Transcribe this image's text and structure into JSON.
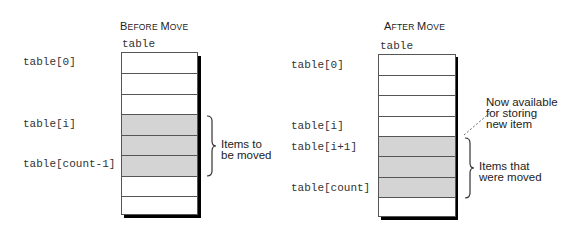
{
  "before": {
    "title_parts": [
      {
        "text": "B",
        "size": "big"
      },
      {
        "text": "EFORE ",
        "size": "small"
      },
      {
        "text": "M",
        "size": "big"
      },
      {
        "text": "OVE",
        "size": "small"
      }
    ],
    "title": "Before Move",
    "array_label": "table",
    "cells": 8,
    "shaded_cells": [
      3,
      4,
      5
    ],
    "index_labels": [
      {
        "text": "table[0]",
        "row": 0
      },
      {
        "text": "table[i]",
        "row": 3
      },
      {
        "text": "table[count-1]",
        "row": 5
      }
    ],
    "annotation": [
      "Items to",
      "be moved"
    ]
  },
  "after": {
    "title_parts": [
      {
        "text": "A",
        "size": "big"
      },
      {
        "text": "FTER ",
        "size": "small"
      },
      {
        "text": "M",
        "size": "big"
      },
      {
        "text": "OVE",
        "size": "small"
      }
    ],
    "title": "After Move",
    "array_label": "table",
    "cells": 8,
    "shaded_cells": [
      4,
      5,
      6
    ],
    "index_labels": [
      {
        "text": "table[0]",
        "row": 0
      },
      {
        "text": "table[i]",
        "row": 3
      },
      {
        "text": "table[i+1]",
        "row": 4
      },
      {
        "text": "table[count]",
        "row": 6
      }
    ],
    "available_note": [
      "Now available",
      "for storing",
      "new item"
    ],
    "annotation": [
      "Items that",
      "were moved"
    ]
  },
  "colors": {
    "shaded": "#d4d4d4",
    "border": "#555555",
    "shadow": "#000000"
  }
}
